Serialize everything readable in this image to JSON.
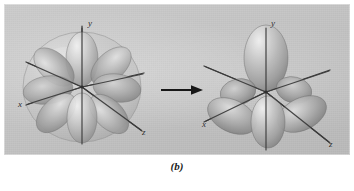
{
  "figure": {
    "caption": "(b)",
    "background_color": "#ffffff",
    "panel_color": "#c4c4c4",
    "transition_arrow": "right-arrow"
  },
  "left_diagram": {
    "name": "f-orbital-with-enclosing-sphere",
    "axes": [
      {
        "id": "y",
        "label": "y",
        "direction": "vertical-up"
      },
      {
        "id": "x",
        "label": "x",
        "direction": "lower-left"
      },
      {
        "id": "z",
        "label": "z",
        "direction": "lower-right"
      }
    ],
    "sphere": {
      "visible": true,
      "style": "translucent-gray"
    },
    "lobe_count": 8,
    "lobe_color": "#9a9a9a"
  },
  "right_diagram": {
    "name": "f-orbital-lobes-only",
    "axes": [
      {
        "id": "y",
        "label": "y",
        "direction": "vertical-up"
      },
      {
        "id": "x",
        "label": "x",
        "direction": "lower-left"
      },
      {
        "id": "z",
        "label": "z",
        "direction": "lower-right"
      }
    ],
    "sphere": {
      "visible": false,
      "style": "none"
    },
    "lobe_count": 6,
    "lobe_color": "#9a9a9a"
  }
}
